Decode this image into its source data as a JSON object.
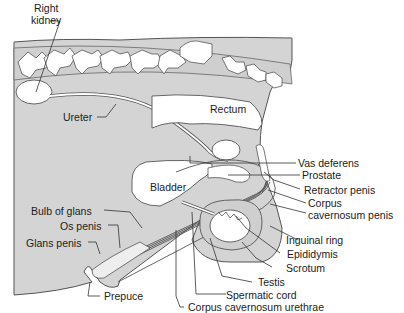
{
  "figure": {
    "colors": {
      "tissue": "#d4d4d4",
      "organ": "#ffffff",
      "outline": "#555555",
      "leader": "#333333"
    },
    "labels": {
      "right_kidney": "Right kidney",
      "right_kidney_line1": "Right",
      "right_kidney_line2": "kidney",
      "ureter": "Ureter",
      "rectum": "Rectum",
      "bladder": "Bladder",
      "vas_deferens": "Vas deferens",
      "prostate": "Prostate",
      "retractor_penis": "Retractor penis",
      "corpus_cavernosum_penis_line1": "Corpus",
      "corpus_cavernosum_penis_line2": "cavernosum penis",
      "inguinal_ring": "Inguinal ring",
      "epididymis": "Epididymis",
      "scrotum": "Scrotum",
      "testis": "Testis",
      "spermatic_cord": "Spermatic cord",
      "corpus_cavernosum_urethrae": "Corpus cavernosum urethrae",
      "bulb_of_glans": "Bulb of glans",
      "os_penis": "Os penis",
      "glans_penis": "Glans penis",
      "prepuce": "Prepuce"
    }
  }
}
